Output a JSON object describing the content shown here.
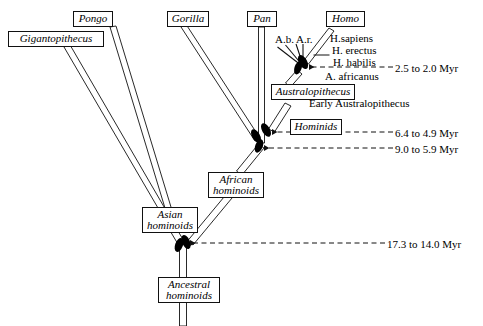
{
  "figure": {
    "kind": "phylogenetic-tree"
  },
  "taxa_boxes": [
    {
      "id": "gigantopithecus",
      "label": "Gigantopithecus",
      "x": 8,
      "y": 31,
      "w": 96,
      "lines": 1
    },
    {
      "id": "pongo",
      "label": "Pongo",
      "x": 73,
      "y": 11,
      "w": 40,
      "lines": 1
    },
    {
      "id": "gorilla",
      "label": "Gorilla",
      "x": 167,
      "y": 11,
      "w": 42,
      "lines": 1
    },
    {
      "id": "pan",
      "label": "Pan",
      "x": 247,
      "y": 11,
      "w": 30,
      "lines": 1
    },
    {
      "id": "homo",
      "label": "Homo",
      "x": 326,
      "y": 11,
      "w": 39,
      "lines": 1
    }
  ],
  "clade_boxes": [
    {
      "id": "australopithecus",
      "label": "Australopithecus",
      "x": 271,
      "y": 84,
      "w": 84,
      "lines": 1
    },
    {
      "id": "hominids",
      "label": "Hominids",
      "x": 290,
      "y": 119,
      "w": 52,
      "lines": 1
    },
    {
      "id": "african-hominoids",
      "line1": "African",
      "line2": "hominoids",
      "x": 208,
      "y": 172,
      "w": 56,
      "lines": 2
    },
    {
      "id": "asian-hominoids",
      "line1": "Asian",
      "line2": "hominoids",
      "x": 142,
      "y": 207,
      "w": 56,
      "lines": 2
    },
    {
      "id": "ancestral-hominoids",
      "line1": "Ancestral",
      "line2": "hominoids",
      "x": 158,
      "y": 277,
      "w": 62,
      "lines": 2
    }
  ],
  "plain_labels": [
    {
      "id": "ab-ar",
      "text": "A.b. A.r.",
      "x": 275,
      "y": 33
    },
    {
      "id": "h-sapiens",
      "text": "H.sapiens",
      "x": 330,
      "y": 32
    },
    {
      "id": "h-erectus",
      "text": "H. erectus",
      "x": 332,
      "y": 44
    },
    {
      "id": "h-habilis",
      "text": "H. habilis",
      "x": 333,
      "y": 56
    },
    {
      "id": "a-africanus",
      "text": "A. africanus",
      "x": 325,
      "y": 70
    },
    {
      "id": "early-australopithecus",
      "text": "Early Australopithecus",
      "x": 309,
      "y": 97
    }
  ],
  "date_annotations": [
    {
      "id": "date-homo",
      "text": "2.5 to 2.0 Myr",
      "label_x": 395,
      "label_y": 62,
      "line_y": 67,
      "line_x1": 309,
      "line_x2": 393
    },
    {
      "id": "date-hominids",
      "text": "6.4 to 4.9 Myr",
      "label_x": 395,
      "label_y": 127,
      "line_y": 132,
      "line_x1": 270,
      "line_x2": 393
    },
    {
      "id": "date-african",
      "text": "9.0 to 5.9 Myr",
      "label_x": 395,
      "label_y": 143,
      "line_y": 148,
      "line_x1": 260,
      "line_x2": 393
    },
    {
      "id": "date-asian",
      "text": "17.3 to 14.0 Myr",
      "label_x": 387,
      "label_y": 238,
      "line_y": 243,
      "line_x1": 183,
      "line_x2": 385
    }
  ],
  "nodes": [
    {
      "id": "node-homo-a",
      "cx": 303,
      "cy": 62,
      "angle": -28
    },
    {
      "id": "node-homo-b",
      "cx": 298,
      "cy": 68,
      "angle": 18
    },
    {
      "id": "node-hominids-a",
      "cx": 266,
      "cy": 130,
      "angle": -30
    },
    {
      "id": "node-hominids-b",
      "cx": 259,
      "cy": 143,
      "angle": 22
    },
    {
      "id": "node-hominids-c",
      "cx": 253,
      "cy": 137,
      "angle": -30
    },
    {
      "id": "node-asian-a",
      "cx": 186,
      "cy": 243,
      "angle": -24
    },
    {
      "id": "node-asian-b",
      "cx": 179,
      "cy": 245,
      "angle": 20
    }
  ],
  "colors": {
    "stroke": "#111111",
    "fill": "#ffffff",
    "node_fill": "#000000",
    "background": "#ffffff"
  }
}
